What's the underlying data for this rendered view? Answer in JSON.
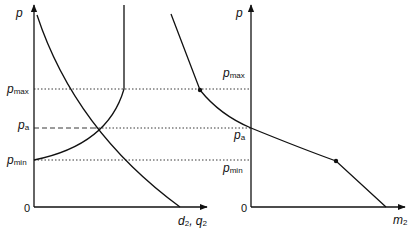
{
  "diagram": {
    "type": "economics-price-quantity",
    "left_panel": {
      "y_axis_label": "p",
      "x_axis_label": {
        "base": "d",
        "sub": "2",
        "sep": ", ",
        "base2": "q",
        "sub2": "2"
      },
      "origin_label": "0",
      "price_levels": [
        {
          "name": "p_max",
          "base": "p",
          "sub": "max"
        },
        {
          "name": "p_a",
          "base": "p",
          "sub": "a"
        },
        {
          "name": "p_min",
          "base": "p",
          "sub": "min"
        }
      ],
      "curves": [
        "demand (downward sloping)",
        "supply (upward from p_min, vertical above p_max)"
      ]
    },
    "right_panel": {
      "y_axis_label": "p",
      "x_axis_label": {
        "base": "m",
        "sub": "2"
      },
      "origin_label": "0",
      "price_levels": [
        {
          "name": "p_max",
          "base": "p",
          "sub": "max"
        },
        {
          "name": "p_a",
          "base": "p",
          "sub": "a"
        },
        {
          "name": "p_min",
          "base": "p",
          "sub": "min"
        }
      ],
      "curves": [
        "import demand with kinks at p_max and p_min"
      ]
    },
    "colors": {
      "ink": "#111111",
      "background": "#ffffff"
    }
  }
}
